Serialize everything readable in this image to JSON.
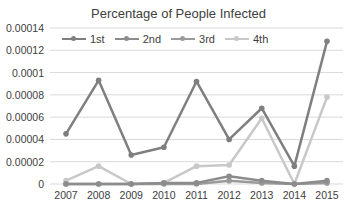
{
  "chart_data": {
    "type": "line",
    "title": "Percentage of People Infected",
    "xlabel": "",
    "ylabel": "",
    "categories": [
      "2007",
      "2008",
      "2009",
      "2010",
      "2011",
      "2012",
      "2013",
      "2014",
      "2015"
    ],
    "ylim": [
      0,
      0.00014
    ],
    "yticks": [
      "0.00014",
      "0.00012",
      "0.0001",
      "0.00008",
      "0.00006",
      "0.00004",
      "0.00002",
      "0"
    ],
    "grid": true,
    "legend_position": "top-left inside",
    "series": [
      {
        "name": "1st",
        "color": "#7f7f7f",
        "values": [
          4.5e-05,
          9.3e-05,
          2.6e-05,
          3.3e-05,
          9.2e-05,
          4e-05,
          6.8e-05,
          1.6e-05,
          0.000128
        ]
      },
      {
        "name": "2nd",
        "color": "#8c8c8c",
        "values": [
          0,
          0,
          0,
          1e-06,
          1e-06,
          7e-06,
          3e-06,
          0,
          3e-06
        ]
      },
      {
        "name": "3rd",
        "color": "#9a9a9a",
        "values": [
          0,
          0,
          0,
          0,
          0,
          3e-06,
          1e-06,
          0,
          1e-06
        ]
      },
      {
        "name": "4th",
        "color": "#c8c8c8",
        "values": [
          3e-06,
          1.6e-05,
          0,
          1e-06,
          1.6e-05,
          1.7e-05,
          5.9e-05,
          0,
          7.8e-05
        ]
      }
    ]
  }
}
